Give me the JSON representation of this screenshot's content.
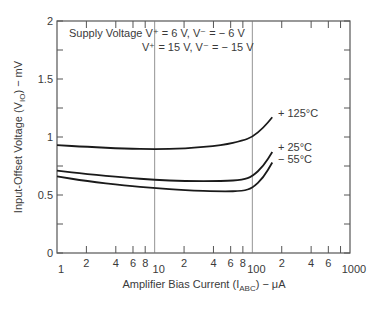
{
  "chart_data": {
    "type": "line",
    "title": "",
    "annotation_lines": [
      "Supply Voltage V⁺ = 6 V, V⁻ = − 6 V",
      "V⁺ = 15 V, V⁻ = − 15 V"
    ],
    "xlabel": "Amplifier Bias Current (I",
    "xlabel_sub": "ABC",
    "xlabel_tail": ") − μA",
    "ylabel": "Input-Offset Voltage (V",
    "ylabel_sub": "IO",
    "ylabel_tail": ") − mV",
    "xscale": "log",
    "xlim": [
      1,
      1000
    ],
    "ylim": [
      0,
      2
    ],
    "x_tick_labels": [
      {
        "v": 1,
        "label": "1"
      },
      {
        "v": 2,
        "label": "2"
      },
      {
        "v": 4,
        "label": "4"
      },
      {
        "v": 6,
        "label": "6"
      },
      {
        "v": 8,
        "label": "8"
      },
      {
        "v": 10,
        "label": "10"
      },
      {
        "v": 20,
        "label": "2"
      },
      {
        "v": 40,
        "label": "4"
      },
      {
        "v": 60,
        "label": "6"
      },
      {
        "v": 80,
        "label": "8"
      },
      {
        "v": 100,
        "label": "100"
      },
      {
        "v": 200,
        "label": "2"
      },
      {
        "v": 400,
        "label": "4"
      },
      {
        "v": 600,
        "label": "6"
      },
      {
        "v": 1000,
        "label": "1000"
      }
    ],
    "y_tick_labels": [
      "0",
      "0.5",
      "1",
      "1.5",
      "2"
    ],
    "grid": "vertical lines at 10 and 100",
    "series": [
      {
        "name": "+ 125°C",
        "x": [
          1,
          2,
          5,
          10,
          20,
          50,
          80,
          100,
          130,
          160
        ],
        "values": [
          0.93,
          0.915,
          0.9,
          0.895,
          0.9,
          0.93,
          0.97,
          1.0,
          1.08,
          1.17
        ]
      },
      {
        "name": "+ 25°C",
        "x": [
          1,
          2,
          5,
          10,
          20,
          50,
          80,
          100,
          130,
          160
        ],
        "values": [
          0.71,
          0.68,
          0.65,
          0.63,
          0.62,
          0.62,
          0.63,
          0.66,
          0.75,
          0.87
        ]
      },
      {
        "name": "− 55°C",
        "x": [
          1,
          2,
          5,
          10,
          20,
          50,
          80,
          100,
          130,
          160
        ],
        "values": [
          0.66,
          0.62,
          0.58,
          0.56,
          0.54,
          0.53,
          0.535,
          0.56,
          0.65,
          0.78
        ]
      }
    ]
  }
}
